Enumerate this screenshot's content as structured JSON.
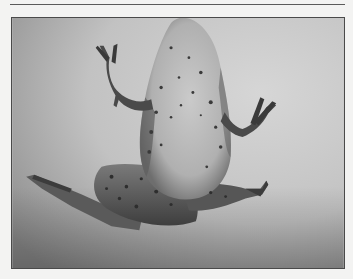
{
  "page": {
    "background_color": "#f3f3f2",
    "rule_color": "#5a5a5a"
  },
  "figure": {
    "style": "grayscale photograph",
    "colors": {
      "background_light": "#d4d4d4",
      "background_dark": "#8e8e8e",
      "belly": "#bdbdbd",
      "skin_dark": "#5c5c5c",
      "spots": "#3a3a3a",
      "limbs": "#4a4a4a"
    }
  }
}
